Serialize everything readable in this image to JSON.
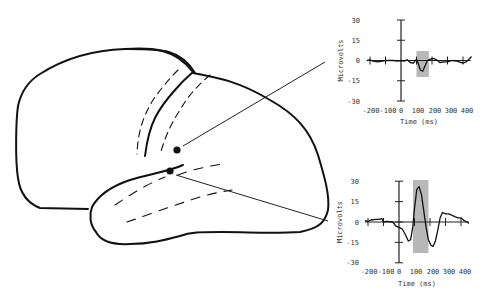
{
  "figure": {
    "electrodes": [
      {
        "id": "upper",
        "label": "electrode above Sylvian fissure",
        "x": 177,
        "y": 150
      },
      {
        "id": "lower",
        "label": "electrode below Sylvian fissure",
        "x": 170,
        "y": 171
      }
    ],
    "colors": {
      "line": "#111111",
      "highlight": "#b8b8b8",
      "text": "#333333"
    }
  },
  "chart_data": [
    {
      "type": "line",
      "title": "",
      "xlabel": "Time (ms)",
      "ylabel": "Microvolts",
      "x_ticks": [
        "-200",
        "-100",
        "0",
        "100",
        "200",
        "300",
        "400"
      ],
      "y_ticks": [
        "30",
        "15",
        "0",
        "-15",
        "-30"
      ],
      "xlim": [
        -200,
        450
      ],
      "ylim": [
        -30,
        30
      ],
      "highlight_window_ms": [
        100,
        180
      ],
      "series": [
        {
          "name": "upper electrode",
          "x": [
            -220,
            -200,
            -180,
            -150,
            -100,
            -50,
            -20,
            0,
            20,
            40,
            60,
            80,
            100,
            110,
            125,
            140,
            155,
            170,
            190,
            210,
            230,
            250,
            280,
            300,
            330,
            360,
            400,
            420,
            440,
            455
          ],
          "y": [
            0,
            0.5,
            -0.5,
            -1,
            0,
            0,
            -0.5,
            0,
            -0.5,
            0.5,
            -1.5,
            -2,
            1,
            -2,
            -7,
            -8,
            -4,
            0,
            1,
            1.5,
            0.5,
            -1.5,
            -1,
            -1,
            0,
            -0.5,
            -2,
            -1,
            1,
            3
          ]
        }
      ]
    },
    {
      "type": "line",
      "title": "",
      "xlabel": "Time (ms)",
      "ylabel": "Microvolts",
      "x_ticks": [
        "-200",
        "-100",
        "0",
        "100",
        "200",
        "300",
        "400"
      ],
      "y_ticks": [
        "30",
        "15",
        "0",
        "-15",
        "-30"
      ],
      "xlim": [
        -200,
        450
      ],
      "ylim": [
        -30,
        30
      ],
      "highlight_window_ms": [
        90,
        190
      ],
      "series": [
        {
          "name": "lower electrode",
          "x": [
            -220,
            -200,
            -180,
            -150,
            -130,
            -110,
            -100,
            -80,
            -40,
            -20,
            0,
            20,
            40,
            60,
            75,
            90,
            100,
            115,
            130,
            145,
            160,
            175,
            190,
            205,
            220,
            235,
            250,
            265,
            280,
            300,
            320,
            340,
            360,
            380,
            400,
            420,
            440,
            450
          ],
          "y": [
            1,
            0.5,
            1.5,
            2,
            2,
            2.5,
            0,
            0.5,
            0,
            -3,
            -4,
            -5,
            -9,
            -14,
            -13,
            -3,
            10,
            24,
            26,
            20,
            8,
            -4,
            -13,
            -17,
            -18,
            -14,
            -6,
            3,
            7,
            6,
            6,
            5,
            4,
            3,
            3,
            1,
            0,
            -1
          ]
        }
      ]
    }
  ],
  "labels": {
    "top": {
      "y_axis_title": "Microvolts",
      "x_axis_title": "Time (ms)",
      "y_ticks": [
        "30",
        "15",
        "0",
        "-15",
        "-30"
      ],
      "x_ticks": [
        "-200",
        "-100",
        "0",
        "100",
        "200",
        "300",
        "400"
      ]
    },
    "bottom": {
      "y_axis_title": "Microvolts",
      "x_axis_title": "Time (ms)",
      "y_ticks": [
        "30",
        "15",
        "0",
        "-15",
        "-30"
      ],
      "x_ticks": [
        "-200",
        "-100",
        "0",
        "100",
        "200",
        "300",
        "400"
      ]
    }
  }
}
